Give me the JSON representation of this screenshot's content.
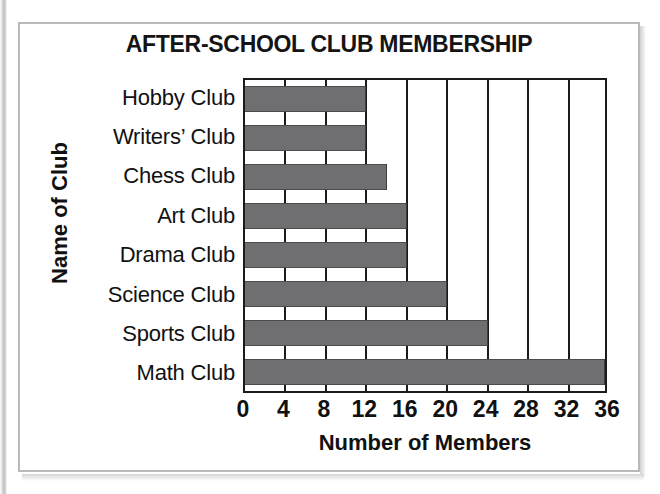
{
  "figure": {
    "frame_color": "#b9b9b9",
    "background": "#ffffff"
  },
  "chart_data": {
    "type": "bar",
    "orientation": "horizontal",
    "title": "AFTER-SCHOOL CLUB MEMBERSHIP",
    "xlabel": "Number of Members",
    "ylabel": "Name of Club",
    "categories": [
      "Hobby Club",
      "Writers’ Club",
      "Chess Club",
      "Art Club",
      "Drama Club",
      "Science Club",
      "Sports Club",
      "Math Club"
    ],
    "values": [
      12,
      12,
      14,
      16,
      16,
      20,
      24,
      36
    ],
    "xlim": [
      0,
      36
    ],
    "xticks": [
      0,
      4,
      8,
      12,
      16,
      20,
      24,
      28,
      32,
      36
    ],
    "xtick_labels": [
      "0",
      "4",
      "8",
      "12",
      "16",
      "20",
      "24",
      "28",
      "32",
      "36"
    ],
    "grid": true,
    "grid_axis": "x",
    "legend": false,
    "bar_color": "#6f6e70",
    "axis_color": "#1b1b1b"
  }
}
